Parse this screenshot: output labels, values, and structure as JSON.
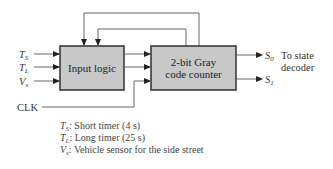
{
  "diagram": {
    "blocks": {
      "input_logic": {
        "label": "Input logic"
      },
      "counter": {
        "label_line1": "2-bit Gray",
        "label_line2": "code counter"
      }
    },
    "inputs": [
      {
        "symbol": "T",
        "sub": "S"
      },
      {
        "symbol": "T",
        "sub": "L"
      },
      {
        "symbol": "V",
        "sub": "s"
      }
    ],
    "clock_label": "CLK",
    "outputs": [
      {
        "symbol": "S",
        "sub": "0"
      },
      {
        "symbol": "S",
        "sub": "1"
      }
    ],
    "output_note_line1": "To state",
    "output_note_line2": "decoder",
    "legend": [
      {
        "symbol": "T",
        "sub": "S",
        "text": ": Short timer (4 s)"
      },
      {
        "symbol": "T",
        "sub": "L",
        "text": ": Long timer (25 s)"
      },
      {
        "symbol": "V",
        "sub": "s",
        "text": ": Vehicle sensor for the side street"
      }
    ],
    "colors": {
      "block_fill": "#c8c8c8",
      "block_stroke": "#3a3a3a",
      "wire": "#555555"
    }
  }
}
